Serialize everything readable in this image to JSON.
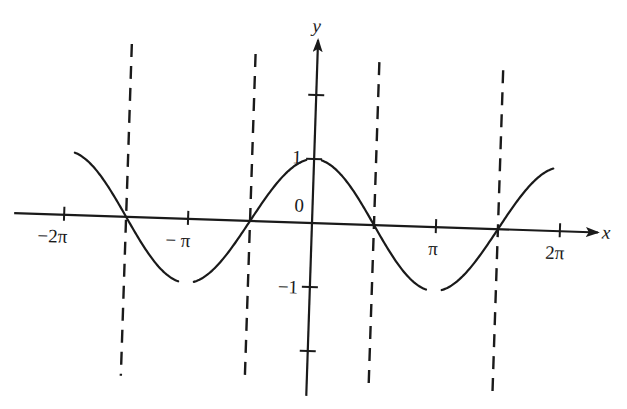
{
  "figure": {
    "axes": {
      "x_label": "x",
      "y_label": "y",
      "origin_label": "0",
      "x_ticks": [
        {
          "label": "−2π",
          "value": -6.2832
        },
        {
          "label": "− π",
          "value": -3.1416
        },
        {
          "label": "π",
          "value": 3.1416
        },
        {
          "label": "2π",
          "value": 6.2832
        }
      ],
      "y_ticks": [
        {
          "label": "1",
          "value": 1
        },
        {
          "label": "−1",
          "value": -1
        }
      ],
      "y_unlabeled_ticks": [
        2,
        -2
      ]
    },
    "curve": {
      "function": "cos x",
      "domain": [
        "-2π",
        "2π"
      ],
      "excluded_points": [
        {
          "x": "-π",
          "y": -1
        },
        {
          "x": "0",
          "y": 1
        },
        {
          "x": "π",
          "y": -1
        }
      ]
    },
    "dashed_lines": [
      {
        "x": "-3π/2"
      },
      {
        "x": "-π/2"
      },
      {
        "x": "π/2"
      },
      {
        "x": "3π/2"
      }
    ],
    "colors": {
      "ink": "#1a1a1a",
      "background": "#ffffff"
    }
  }
}
